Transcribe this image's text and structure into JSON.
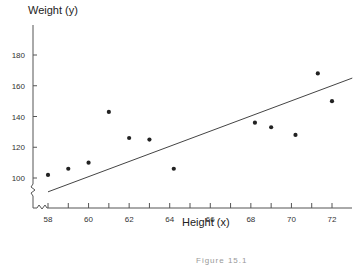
{
  "chart_data": {
    "type": "scatter",
    "title": "",
    "xlabel": "Height (x)",
    "ylabel": "Weight (y)",
    "xlim": [
      57.5,
      73
    ],
    "ylim": [
      85,
      195
    ],
    "x_ticks": [
      58,
      60,
      62,
      64,
      66,
      68,
      70,
      72
    ],
    "y_ticks": [
      100,
      120,
      140,
      160,
      180
    ],
    "grid": false,
    "legend": null,
    "axis_break": true,
    "series": [
      {
        "name": "observations",
        "points": [
          {
            "x": 58,
            "y": 102
          },
          {
            "x": 59,
            "y": 106
          },
          {
            "x": 60,
            "y": 110
          },
          {
            "x": 61,
            "y": 143
          },
          {
            "x": 62,
            "y": 126
          },
          {
            "x": 63,
            "y": 125
          },
          {
            "x": 64.2,
            "y": 106
          },
          {
            "x": 68.2,
            "y": 136
          },
          {
            "x": 69,
            "y": 133
          },
          {
            "x": 70.2,
            "y": 128
          },
          {
            "x": 71.3,
            "y": 168
          },
          {
            "x": 72,
            "y": 150
          }
        ]
      },
      {
        "name": "regression line",
        "type": "line",
        "points": [
          {
            "x": 58,
            "y": 91
          },
          {
            "x": 73,
            "y": 165
          }
        ]
      }
    ],
    "caption": "Figure 15.1"
  },
  "labels": {
    "y_title": "Weight (y)",
    "x_title": "Height (x)",
    "caption": "Figure 15.1"
  }
}
